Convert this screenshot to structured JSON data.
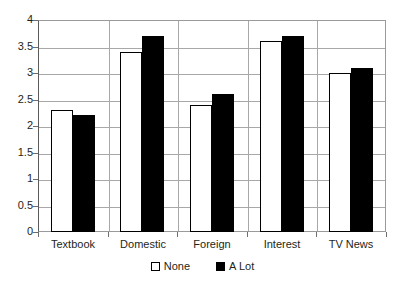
{
  "chart_data": {
    "type": "bar",
    "title": "",
    "subtitle": "",
    "xlabel": "",
    "ylabel": "",
    "categories": [
      "Textbook",
      "Domestic",
      "Foreign",
      "Interest",
      "TV News"
    ],
    "series": [
      {
        "name": "None",
        "values": [
          2.3,
          3.4,
          2.4,
          3.6,
          3.0
        ],
        "color": "#ffffff",
        "border_color": "#000000"
      },
      {
        "name": "A Lot",
        "values": [
          2.2,
          3.7,
          2.6,
          3.7,
          3.1
        ],
        "color": "#000000",
        "border_color": "#000000"
      }
    ],
    "ylim": [
      0,
      4
    ],
    "ytick_values": [
      0,
      0.5,
      1,
      1.5,
      2,
      2.5,
      3,
      3.5,
      4
    ],
    "ytick_labels": [
      "0",
      "0.5",
      "1",
      "1.5",
      "2",
      "2.5",
      "3",
      "3.5",
      "4"
    ],
    "grid": true,
    "grid_axis": "y",
    "grid_color": "#a8a8a8",
    "legend_position": "bottom",
    "plot_background": "#ffffff",
    "axis_color": "#5b5b5b"
  },
  "legend": {
    "items": [
      {
        "label": "None"
      },
      {
        "label": "A Lot"
      }
    ]
  }
}
